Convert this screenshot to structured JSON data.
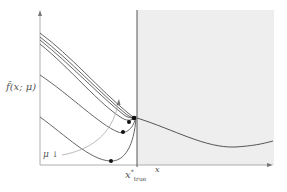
{
  "figure": {
    "y_label": "f̃(x; μ)",
    "x_label": "x",
    "x_tick_label": "x*true",
    "x_tick_main": "x",
    "x_tick_sup": "*",
    "x_tick_sub": "true",
    "mu_label": "μ ↓",
    "mu_text": "μ",
    "mu_arrow": "↓",
    "colors": {
      "curve": "#555555",
      "shade": "#eeeeee",
      "axis": "#888888",
      "arrow": "#aaaaaa",
      "dot": "#111111"
    },
    "curves_left_start_y": [
      33,
      37,
      40,
      44,
      75,
      117
    ],
    "minimizer_dots": [
      [
        134,
        118
      ],
      [
        129,
        122
      ],
      [
        123,
        132
      ],
      [
        111,
        161
      ]
    ]
  }
}
